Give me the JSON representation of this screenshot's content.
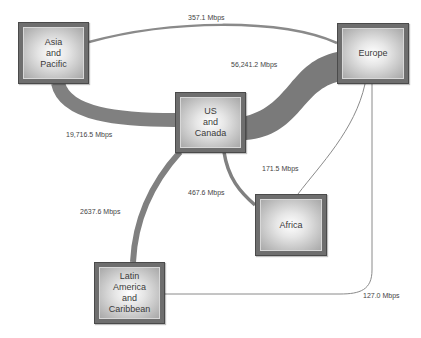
{
  "diagram": {
    "type": "network-flow",
    "units": "Mbps",
    "colors": {
      "edge": "#888888",
      "node_frame": "#6e6e6e",
      "node_inner_center": "#ffffff",
      "text": "#3a3a3a"
    },
    "nodes": [
      {
        "id": "asia",
        "label": "Asia\nand\nPacific"
      },
      {
        "id": "europe",
        "label": "Europe"
      },
      {
        "id": "us",
        "label": "US\nand\nCanada"
      },
      {
        "id": "africa",
        "label": "Africa"
      },
      {
        "id": "latam",
        "label": "Latin\nAmerica\nand\nCaribbean"
      }
    ],
    "edges": [
      {
        "from": "Asia and Pacific",
        "to": "Europe",
        "label": "357.1 Mbps",
        "value": 357.1
      },
      {
        "from": "US and Canada",
        "to": "Europe",
        "label": "56,241.2 Mbps",
        "value": 56241.2
      },
      {
        "from": "Asia and Pacific",
        "to": "US and Canada",
        "label": "19,716.5 Mbps",
        "value": 19716.5
      },
      {
        "from": "Europe",
        "to": "Africa",
        "label": "171.5 Mbps",
        "value": 171.5
      },
      {
        "from": "US and Canada",
        "to": "Africa",
        "label": "467.6 Mbps",
        "value": 467.6
      },
      {
        "from": "US and Canada",
        "to": "Latin America and Caribbean",
        "label": "2637.6 Mbps",
        "value": 2637.6
      },
      {
        "from": "Europe",
        "to": "Latin America and Caribbean",
        "label": "127.0 Mbps",
        "value": 127.0
      }
    ]
  }
}
